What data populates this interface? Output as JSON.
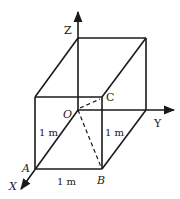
{
  "figure": {
    "type": "3d-box-with-axes",
    "axes": {
      "x_label": "X",
      "y_label": "Y",
      "z_label": "Z"
    },
    "points": {
      "origin": "O",
      "a": "A",
      "b": "B",
      "c": "C"
    },
    "dimensions": {
      "edge_oa": "1 m",
      "edge_ab": "1 m",
      "edge_vertical_b": "1 m"
    },
    "colors": {
      "line": "#1a1a1a",
      "background": "#ffffff"
    }
  }
}
